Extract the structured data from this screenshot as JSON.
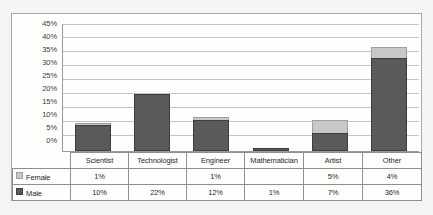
{
  "chart_data": {
    "type": "bar",
    "subtype": "stacked-column",
    "title": "",
    "xlabel": "",
    "ylabel": "",
    "ylim": [
      0,
      45
    ],
    "ytick_labels": [
      "45%",
      "40%",
      "35%",
      "30%",
      "25%",
      "20%",
      "15%",
      "10%",
      "5%",
      "0%"
    ],
    "ytick_values": [
      45,
      40,
      35,
      30,
      25,
      20,
      15,
      10,
      5,
      0
    ],
    "grid": true,
    "legend_position": "table-row-labels",
    "categories": [
      "Scientist",
      "Technologist",
      "Engineer",
      "Mathematician",
      "Artist",
      "Other"
    ],
    "series": [
      {
        "name": "Female",
        "color": "#c8c8c8",
        "values": [
          1,
          null,
          1,
          null,
          5,
          4
        ],
        "labels": [
          "1%",
          "",
          "1%",
          "",
          "5%",
          "4%"
        ]
      },
      {
        "name": "Male",
        "color": "#5a5a5a",
        "values": [
          10,
          22,
          12,
          1,
          7,
          36
        ],
        "labels": [
          "10%",
          "22%",
          "12%",
          "1%",
          "7%",
          "36%"
        ]
      }
    ],
    "stack_order": [
      "Male",
      "Female"
    ]
  },
  "table": {
    "column_headers": [
      "Scientist",
      "Technologist",
      "Engineer",
      "Mathematician",
      "Artist",
      "Other"
    ],
    "rows": [
      {
        "label": "Female",
        "swatch": "legend-swatch-female",
        "cells": [
          "1%",
          "",
          "1%",
          "",
          "5%",
          "4%"
        ]
      },
      {
        "label": "Male",
        "swatch": "legend-swatch-male",
        "cells": [
          "10%",
          "22%",
          "12%",
          "1%",
          "7%",
          "36%"
        ]
      }
    ]
  },
  "colors": {
    "female": "#c8c8c8",
    "male": "#5a5a5a",
    "gridline": "#c4c4c4",
    "axis": "#9a9a9a",
    "border": "#a9a9a9",
    "page_background": "#f4f4f2",
    "chart_background": "#fdfdfc"
  }
}
